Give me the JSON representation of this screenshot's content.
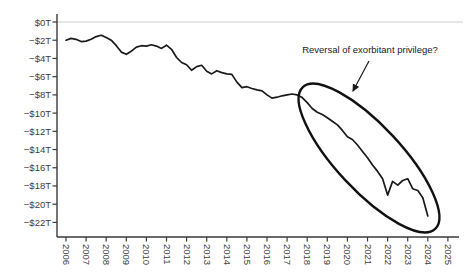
{
  "window": {
    "type": "static-chart-image",
    "background": "#ffffff"
  },
  "colors": {
    "line": "#1a1a1a",
    "axis": "#3a3a3a",
    "tick_label": "#3d3d3d",
    "grid": "#cccccc",
    "ellipse": "#111111",
    "arrow": "#1a1a1a",
    "background": "#ffffff"
  },
  "annotation": {
    "text": "Reversal of exorbitant privilege?"
  },
  "y_axis": {
    "tick_labels": [
      "$0T",
      "−$2T",
      "−$4T",
      "−$6T",
      "−$8T",
      "−$10T",
      "−$12T",
      "−$14T",
      "−$16T",
      "−$18T",
      "−$20T",
      "−$22T"
    ],
    "tick_values": [
      0,
      -2,
      -4,
      -6,
      -8,
      -10,
      -12,
      -14,
      -16,
      -18,
      -20,
      -22
    ]
  },
  "x_axis": {
    "tick_labels": [
      "2006",
      "2007",
      "2008",
      "2009",
      "2010",
      "2011",
      "2012",
      "2013",
      "2014",
      "2015",
      "2016",
      "2017",
      "2018",
      "2019",
      "2020",
      "2021",
      "2022",
      "2023",
      "2024",
      "2025"
    ],
    "tick_values": [
      2006,
      2007,
      2008,
      2009,
      2010,
      2011,
      2012,
      2013,
      2014,
      2015,
      2016,
      2017,
      2018,
      2019,
      2020,
      2021,
      2022,
      2023,
      2024,
      2025
    ]
  },
  "chart_data": {
    "type": "line",
    "title": "",
    "xlabel": "",
    "ylabel": "",
    "units": "trillions of dollars",
    "xlim": [
      2005.5,
      2025.5
    ],
    "ylim": [
      -23.5,
      0.5
    ],
    "grid": "single gridline at $0T only",
    "legend": "none",
    "x": [
      2006.0,
      2006.25,
      2006.5,
      2006.75,
      2007.0,
      2007.25,
      2007.5,
      2007.75,
      2008.0,
      2008.25,
      2008.5,
      2008.75,
      2009.0,
      2009.25,
      2009.5,
      2009.75,
      2010.0,
      2010.25,
      2010.5,
      2010.75,
      2011.0,
      2011.25,
      2011.5,
      2011.75,
      2012.0,
      2012.25,
      2012.5,
      2012.75,
      2013.0,
      2013.25,
      2013.5,
      2013.75,
      2014.0,
      2014.25,
      2014.5,
      2014.75,
      2015.0,
      2015.25,
      2015.5,
      2015.75,
      2016.0,
      2016.25,
      2016.5,
      2016.75,
      2017.0,
      2017.25,
      2017.5,
      2017.75,
      2018.0,
      2018.25,
      2018.5,
      2018.75,
      2019.0,
      2019.25,
      2019.5,
      2019.75,
      2020.0,
      2020.25,
      2020.5,
      2020.75,
      2021.0,
      2021.25,
      2021.5,
      2021.75,
      2022.0,
      2022.25,
      2022.5,
      2022.75,
      2023.0,
      2023.25,
      2023.5,
      2023.75,
      2024.0
    ],
    "values": [
      -2.0,
      -1.8,
      -1.9,
      -2.15,
      -2.1,
      -1.9,
      -1.6,
      -1.45,
      -1.7,
      -2.0,
      -2.6,
      -3.3,
      -3.55,
      -3.2,
      -2.75,
      -2.6,
      -2.65,
      -2.5,
      -2.65,
      -2.9,
      -2.55,
      -3.0,
      -3.9,
      -4.45,
      -4.7,
      -5.3,
      -4.9,
      -4.75,
      -5.4,
      -5.7,
      -5.35,
      -5.55,
      -5.7,
      -5.75,
      -6.6,
      -7.2,
      -7.1,
      -7.3,
      -7.45,
      -7.55,
      -8.0,
      -8.35,
      -8.25,
      -8.1,
      -8.0,
      -7.9,
      -8.0,
      -8.3,
      -8.85,
      -9.5,
      -9.9,
      -10.15,
      -10.5,
      -10.9,
      -11.3,
      -11.9,
      -12.6,
      -12.9,
      -13.5,
      -14.2,
      -14.9,
      -15.7,
      -16.4,
      -17.2,
      -19.0,
      -17.5,
      -17.9,
      -17.4,
      -17.2,
      -18.3,
      -18.5,
      -19.3,
      -21.3
    ],
    "annotations": [
      {
        "text": "Reversal of exorbitant privilege?",
        "type": "arrow-and-ellipse",
        "ellipse_highlights_years": "2018–2024"
      }
    ]
  }
}
